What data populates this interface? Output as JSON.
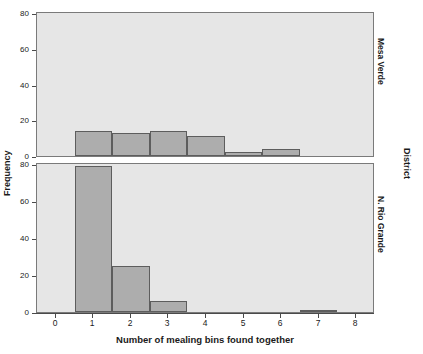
{
  "chart_data": {
    "type": "bar",
    "title": "",
    "subtitle": "",
    "xlabel": "Number of mealing bins found together",
    "ylabel": "Frequency",
    "panel_group_label": "District",
    "grid": false,
    "legend": "none",
    "xlim": [
      -0.5,
      8.5
    ],
    "ylim": [
      0,
      80
    ],
    "xticks": [
      0,
      1,
      2,
      3,
      4,
      5,
      6,
      7,
      8
    ],
    "xtick_labels": [
      "0",
      "1",
      "2",
      "3",
      "4",
      "5",
      "6",
      "7",
      "8"
    ],
    "yticks": [
      0,
      20,
      40,
      60,
      80
    ],
    "ytick_labels": [
      "0",
      "20",
      "40",
      "60",
      "80"
    ],
    "categories": [
      0,
      1,
      2,
      3,
      4,
      5,
      6,
      7,
      8
    ],
    "panels": [
      {
        "name": "Mesa Verde",
        "values": [
          0,
          14,
          13,
          14,
          11,
          2,
          4,
          0,
          0
        ]
      },
      {
        "name": "N. Rio Grande",
        "values": [
          0,
          79,
          25,
          6,
          0,
          0,
          0,
          1,
          0
        ]
      }
    ]
  },
  "axes": {
    "ylabel": "Frequency",
    "xlabel": "Number of mealing bins found together",
    "ytick_labels": [
      "0",
      "20",
      "40",
      "60",
      "80"
    ],
    "xtick_labels": [
      "0",
      "1",
      "2",
      "3",
      "4",
      "5",
      "6",
      "7",
      "8"
    ]
  },
  "panel_labels": {
    "top": "Mesa Verde",
    "bottom": "N. Rio Grande",
    "group": "District"
  },
  "colors": {
    "bar_fill": "#adadad",
    "bar_edge": "#5d5d5d",
    "panel_background": "#e6e6e6",
    "panel_border": "#7a7a7a",
    "figure_background": "#ffffff",
    "text": "#1a1a1a"
  }
}
